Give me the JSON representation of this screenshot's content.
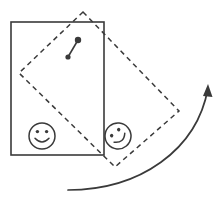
{
  "figure": {
    "canvas": {
      "width": 224,
      "height": 205,
      "background": "#ffffff"
    },
    "ink_color": "#3a3a3a",
    "shapes": {
      "solid_rectangle": {
        "label": "original-rectangle",
        "style": "solid",
        "x": 11,
        "y": 22,
        "width": 93,
        "height": 133,
        "rotation_deg": 0
      },
      "dashed_rectangle": {
        "label": "rotated-rectangle",
        "style": "dashed",
        "dash_pattern": "5 4",
        "rotation_deg": -40,
        "corners": [
          {
            "name": "top",
            "x": 83,
            "y": 12
          },
          {
            "name": "right",
            "x": 179,
            "y": 111
          },
          {
            "name": "bottom",
            "x": 115,
            "y": 167
          },
          {
            "name": "left",
            "x": 19,
            "y": 73
          }
        ]
      },
      "pivot_marker": {
        "label": "center-of-rotation-marker",
        "tail": {
          "x": 68,
          "y": 57
        },
        "head": {
          "x": 78,
          "y": 40
        },
        "tail_dot_radius": 2.6,
        "head_dot_radius": 3.2
      },
      "smiley_original": {
        "label": "smiley-face-original",
        "cx": 42,
        "cy": 136,
        "radius": 13,
        "rotation_deg": 0
      },
      "smiley_rotated": {
        "label": "smiley-face-rotated",
        "cx": 118,
        "cy": 136,
        "radius": 13,
        "rotation_deg": -40
      },
      "rotation_arrow": {
        "label": "rotation-direction-arrow",
        "start": {
          "x": 68,
          "y": 190
        },
        "control1": {
          "x": 140,
          "y": 190
        },
        "control2": {
          "x": 197,
          "y": 150
        },
        "end": {
          "x": 208,
          "y": 88
        },
        "arrowhead_tip": {
          "x": 208,
          "y": 84
        },
        "direction": "counterclockwise-upward"
      }
    }
  }
}
